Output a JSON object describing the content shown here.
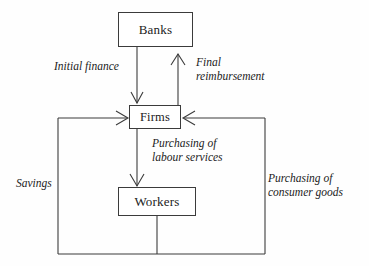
{
  "diagram": {
    "type": "flow-diagram",
    "background_color": "#fefefe",
    "line_color": "#3b3b3b",
    "text_color": "#1b1b1b",
    "nodes": [
      {
        "id": "banks",
        "label": "Banks"
      },
      {
        "id": "firms",
        "label": "Firms"
      },
      {
        "id": "workers",
        "label": "Workers"
      }
    ],
    "edge_labels": [
      {
        "id": "initial-finance",
        "text": "Initial finance",
        "from": "banks",
        "to": "firms"
      },
      {
        "id": "final-reimbursement",
        "text": "Final\nreimbursement",
        "from": "firms",
        "to": "banks"
      },
      {
        "id": "purchasing-labour",
        "text": "Purchasing of\nlabour services",
        "from": "firms",
        "to": "workers"
      },
      {
        "id": "savings",
        "text": "Savings",
        "from": "workers",
        "to": "firms"
      },
      {
        "id": "purchasing-consumer",
        "text": "Purchasing of\nconsumer goods",
        "from": "workers",
        "to": "firms"
      }
    ]
  }
}
